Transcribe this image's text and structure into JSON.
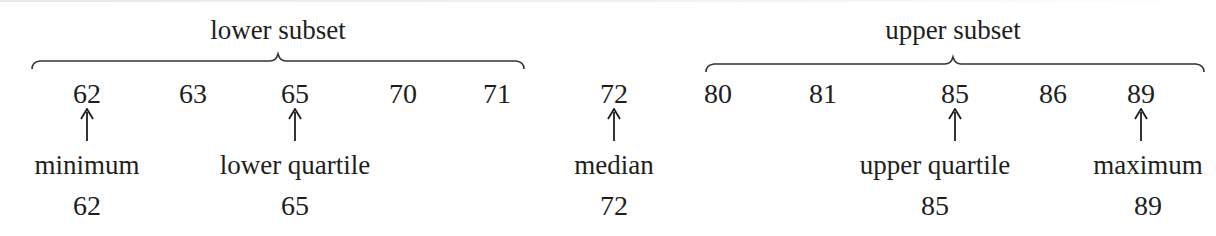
{
  "subsets": {
    "lower": {
      "title": "lower subset",
      "center_x": 278,
      "x_start": 32,
      "x_end": 524
    },
    "upper": {
      "title": "upper subset",
      "center_x": 953,
      "x_start": 706,
      "x_end": 1204
    }
  },
  "numbers": [
    {
      "value": "62",
      "x": 87
    },
    {
      "value": "63",
      "x": 193
    },
    {
      "value": "65",
      "x": 295
    },
    {
      "value": "70",
      "x": 403
    },
    {
      "value": "71",
      "x": 497
    },
    {
      "value": "72",
      "x": 614
    },
    {
      "value": "80",
      "x": 718
    },
    {
      "value": "81",
      "x": 823
    },
    {
      "value": "85",
      "x": 955
    },
    {
      "value": "86",
      "x": 1053
    },
    {
      "value": "89",
      "x": 1141
    }
  ],
  "markers": [
    {
      "label": "minimum",
      "value": "62",
      "x": 87
    },
    {
      "label": "lower quartile",
      "value": "65",
      "x": 295
    },
    {
      "label": "median",
      "value": "72",
      "x": 614
    },
    {
      "label": "upper quartile",
      "value": "85",
      "x": 955
    },
    {
      "label": "maximum",
      "value": "89",
      "x": 1141
    }
  ],
  "colors": {
    "text": "#1e1e1e",
    "background": "#ffffff"
  }
}
